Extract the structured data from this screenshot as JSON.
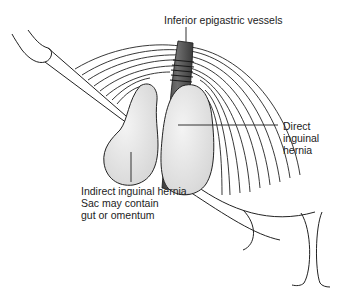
{
  "figure": {
    "labels": {
      "epigastric": "Inferior epigastric vessels",
      "direct": "Direct\ninguinal\nhernia",
      "indirect": "Indirect inguinal hernia.\nSac may contain\ngut or omentum"
    },
    "colors": {
      "line": "#222222",
      "sac_fill": "#e6e6e6",
      "vessel_fill": "#5a5a5a",
      "text": "#222222",
      "background": "#ffffff"
    }
  }
}
